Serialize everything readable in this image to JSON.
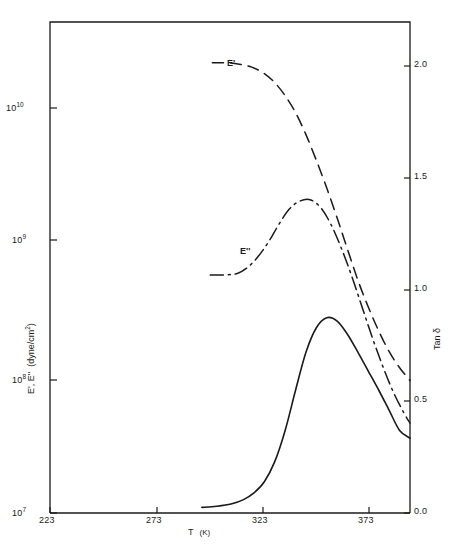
{
  "chart_data": {
    "type": "line",
    "title": "",
    "xlabel": "T (K)",
    "ylabel_left": "E', E'' (dyne/cm²)",
    "ylabel_right": "Tan δ",
    "x_ticks": [
      223,
      273,
      323,
      373
    ],
    "x_tick_labels": [
      "223",
      "273",
      "323",
      "373"
    ],
    "xlim": [
      223,
      396
    ],
    "y_left_scale": "log",
    "y_left_ticks": [
      10000000,
      100000000,
      1000000000,
      10000000000
    ],
    "y_left_tick_labels": [
      {
        "mantissa": "10",
        "exponent": "7"
      },
      {
        "mantissa": "10",
        "exponent": "8"
      },
      {
        "mantissa": "10",
        "exponent": "9"
      },
      {
        "mantissa": "10",
        "exponent": "10"
      }
    ],
    "ylim_left": [
      10000000,
      42000000000
    ],
    "y_right_ticks": [
      0.0,
      0.5,
      1.0,
      1.5,
      2.0
    ],
    "y_right_tick_labels": [
      "0.0",
      "0.5",
      "1.0",
      "1.5",
      "2.0"
    ],
    "ylim_right": [
      0.0,
      2.2
    ],
    "grid": false,
    "legend_position": "inline-annotations",
    "series": [
      {
        "name": "E'",
        "label": "E'",
        "axis": "left",
        "style": "dashed",
        "color": "#1a1a1a",
        "annotation": {
          "text": "E'",
          "x": 298,
          "y": 22000000000
        },
        "points": [
          {
            "x": 301,
            "y": 21000000000
          },
          {
            "x": 308,
            "y": 21000000000
          },
          {
            "x": 314,
            "y": 20500000000
          },
          {
            "x": 320,
            "y": 19500000000
          },
          {
            "x": 326,
            "y": 17500000000
          },
          {
            "x": 331,
            "y": 15000000000
          },
          {
            "x": 336,
            "y": 12000000000
          },
          {
            "x": 341,
            "y": 9000000000
          },
          {
            "x": 346,
            "y": 6200000000
          },
          {
            "x": 351,
            "y": 4000000000
          },
          {
            "x": 356,
            "y": 2500000000
          },
          {
            "x": 361,
            "y": 1500000000
          },
          {
            "x": 366,
            "y": 880000000
          },
          {
            "x": 371,
            "y": 520000000
          },
          {
            "x": 376,
            "y": 330000000
          },
          {
            "x": 381,
            "y": 220000000
          },
          {
            "x": 386,
            "y": 155000000
          },
          {
            "x": 391,
            "y": 118000000
          },
          {
            "x": 396,
            "y": 95000000
          }
        ]
      },
      {
        "name": "E''",
        "label": "E''",
        "axis": "left",
        "style": "dash-dot",
        "color": "#1a1a1a",
        "annotation": {
          "text": "E''",
          "x": 318,
          "y": 880000000
        },
        "points": [
          {
            "x": 300,
            "y": 570000000
          },
          {
            "x": 307,
            "y": 572000000
          },
          {
            "x": 313,
            "y": 585000000
          },
          {
            "x": 318,
            "y": 650000000
          },
          {
            "x": 323,
            "y": 780000000
          },
          {
            "x": 328,
            "y": 1000000000
          },
          {
            "x": 333,
            "y": 1350000000
          },
          {
            "x": 338,
            "y": 1750000000
          },
          {
            "x": 343,
            "y": 2000000000
          },
          {
            "x": 348,
            "y": 2050000000
          },
          {
            "x": 353,
            "y": 1800000000
          },
          {
            "x": 358,
            "y": 1350000000
          },
          {
            "x": 363,
            "y": 900000000
          },
          {
            "x": 368,
            "y": 560000000
          },
          {
            "x": 373,
            "y": 330000000
          },
          {
            "x": 378,
            "y": 195000000
          },
          {
            "x": 383,
            "y": 120000000
          },
          {
            "x": 388,
            "y": 78000000
          },
          {
            "x": 393,
            "y": 55000000
          },
          {
            "x": 396,
            "y": 46000000
          }
        ]
      },
      {
        "name": "Tan delta",
        "label": "Tan δ",
        "axis": "right",
        "style": "solid",
        "color": "#1a1a1a",
        "annotation": null,
        "points": [
          {
            "x": 296,
            "y": 0.025
          },
          {
            "x": 303,
            "y": 0.03
          },
          {
            "x": 310,
            "y": 0.04
          },
          {
            "x": 316,
            "y": 0.06
          },
          {
            "x": 321,
            "y": 0.09
          },
          {
            "x": 326,
            "y": 0.14
          },
          {
            "x": 331,
            "y": 0.23
          },
          {
            "x": 336,
            "y": 0.37
          },
          {
            "x": 341,
            "y": 0.55
          },
          {
            "x": 346,
            "y": 0.72
          },
          {
            "x": 351,
            "y": 0.83
          },
          {
            "x": 356,
            "y": 0.875
          },
          {
            "x": 361,
            "y": 0.86
          },
          {
            "x": 366,
            "y": 0.8
          },
          {
            "x": 371,
            "y": 0.72
          },
          {
            "x": 376,
            "y": 0.635
          },
          {
            "x": 381,
            "y": 0.55
          },
          {
            "x": 386,
            "y": 0.46
          },
          {
            "x": 391,
            "y": 0.37
          },
          {
            "x": 396,
            "y": 0.335
          }
        ]
      }
    ]
  },
  "axes": {
    "x_title": "T",
    "x_title_unit": "(K)",
    "y_left_title_main": "E', E''",
    "y_left_title_unit": "(dyne/cm",
    "y_left_title_sup": "2",
    "y_left_title_close": ")",
    "y_right_title": "Tan δ"
  },
  "labels": {
    "x_223": "223",
    "x_273": "273",
    "x_323": "323",
    "x_373": "373",
    "y_e10_base": "10",
    "y_e10_exp": "10",
    "y_e9_base": "10",
    "y_e9_exp": "9",
    "y_e8_base": "10",
    "y_e8_exp": "8",
    "y_e7_base": "10",
    "y_e7_exp": "7",
    "r_20": "2.0",
    "r_15": "1.5",
    "r_10": "1.0",
    "r_05": "0.5",
    "r_00": "0.0",
    "curve_e_prime": "E'",
    "curve_e_double_prime": "E''"
  },
  "style": {
    "line_color": "#1a1a1a",
    "background": "#ffffff",
    "frame_color": "#1a1a1a"
  }
}
